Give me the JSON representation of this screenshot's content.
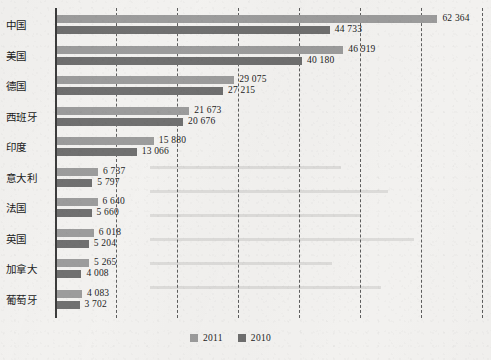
{
  "chart_data": {
    "type": "bar",
    "orientation": "horizontal",
    "title": "",
    "subtitle": "",
    "xlabel": "",
    "ylabel": "",
    "categories": [
      "中国",
      "美国",
      "德国",
      "西班牙",
      "印度",
      "意大利",
      "法国",
      "英国",
      "加拿大",
      "葡萄牙"
    ],
    "series": [
      {
        "name": "2011",
        "color": "#9b9b9b",
        "values": [
          62364,
          46919,
          29075,
          21673,
          15880,
          6737,
          6640,
          6018,
          5265,
          4083
        ],
        "value_labels": [
          "62 364",
          "46 919",
          "29 075",
          "21 673",
          "15 880",
          "6 737",
          "6 640",
          "6 018",
          "5 265",
          "4 083"
        ]
      },
      {
        "name": "2010",
        "color": "#6e6e6e",
        "values": [
          44733,
          40180,
          27215,
          20676,
          13066,
          5797,
          5660,
          5204,
          4008,
          3702
        ],
        "value_labels": [
          "44 733",
          "40 180",
          "27 215",
          "20 676",
          "13 066",
          "5 797",
          "5 660",
          "5 204",
          "4 008",
          "3 702"
        ]
      }
    ],
    "xlim": [
      0,
      70000
    ],
    "gridline_values": [
      10000,
      20000,
      30000,
      40000,
      50000,
      60000,
      70000
    ],
    "grid": true,
    "grid_style": "dashed",
    "legend": {
      "position": "bottom",
      "entries": [
        {
          "label": "2011",
          "color": "#9b9b9b"
        },
        {
          "label": "2010",
          "color": "#6e6e6e"
        }
      ]
    },
    "axis_color": "#3a3a3a",
    "background": "#f2f1ef"
  }
}
